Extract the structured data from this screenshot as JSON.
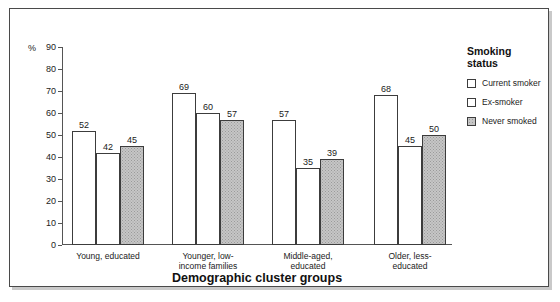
{
  "chart_data": {
    "type": "bar",
    "title": "",
    "xlabel": "Demographic cluster groups",
    "ylabel": "",
    "yunit": "%",
    "ylim": [
      0,
      90
    ],
    "yticks": [
      0,
      10,
      20,
      30,
      40,
      50,
      60,
      70,
      80,
      90
    ],
    "grid": false,
    "legend_position": "right",
    "legend_title": "Smoking\nstatus",
    "categories": [
      "Young, educated",
      "Younger, low-\nincome families",
      "Middle-aged,\neducated",
      "Older, less-\neducated"
    ],
    "series": [
      {
        "name": "Current smoker",
        "values": [
          52,
          69,
          57,
          68
        ],
        "fill": "white"
      },
      {
        "name": "Ex-smoker",
        "values": [
          42,
          60,
          35,
          45
        ],
        "fill": "white"
      },
      {
        "name": "Never smoked",
        "values": [
          45,
          57,
          39,
          50
        ],
        "fill": "gray-stipple"
      }
    ]
  },
  "colors": {
    "frame_border": "#4a4a4a",
    "bar_border": "#3c3c3c",
    "bar_white": "#ffffff",
    "bar_gray": "#c6c6c6",
    "axis": "#555555",
    "text": "#222222"
  }
}
